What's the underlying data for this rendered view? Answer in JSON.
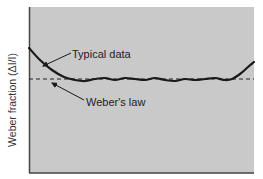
{
  "chart_data": {
    "type": "line",
    "title": "",
    "xlabel": "",
    "ylabel": "Weber fraction (ΔI/I)",
    "grid": false,
    "legend": "none",
    "colors": {
      "plot_bg": "#c9c9c9",
      "line": "#1a1a1a",
      "axis": "#444444",
      "text": "#333333"
    },
    "series": [
      {
        "name": "Typical data",
        "style": "solid",
        "description": "U-shaped: high at low intensities, flat with small wiggles across middle range, rising at high intensities",
        "points_px": [
          [
            29,
            48
          ],
          [
            40,
            60
          ],
          [
            52,
            70
          ],
          [
            64,
            77
          ],
          [
            75,
            80
          ],
          [
            85,
            81
          ],
          [
            95,
            79
          ],
          [
            105,
            78
          ],
          [
            115,
            80
          ],
          [
            125,
            78
          ],
          [
            135,
            79
          ],
          [
            145,
            80
          ],
          [
            155,
            78
          ],
          [
            165,
            80
          ],
          [
            175,
            81
          ],
          [
            185,
            79
          ],
          [
            195,
            80
          ],
          [
            205,
            79
          ],
          [
            215,
            78
          ],
          [
            225,
            80
          ],
          [
            232,
            79
          ],
          [
            240,
            74
          ],
          [
            248,
            67
          ],
          [
            254,
            62
          ]
        ]
      },
      {
        "name": "Weber's law",
        "style": "dashed",
        "description": "Constant horizontal line",
        "points_px": [
          [
            29,
            79
          ],
          [
            254,
            79
          ]
        ]
      }
    ],
    "annotations": [
      {
        "text": "Typical data",
        "x": 72,
        "y": 58,
        "arrow_to": [
          43,
          66
        ]
      },
      {
        "text": "Weber's law",
        "x": 86,
        "y": 106,
        "arrow_to": [
          52,
          83
        ]
      }
    ]
  },
  "labels": {
    "ylabel": "Weber fraction (ΔI/I)",
    "typical": "Typical data",
    "weber": "Weber's law"
  }
}
